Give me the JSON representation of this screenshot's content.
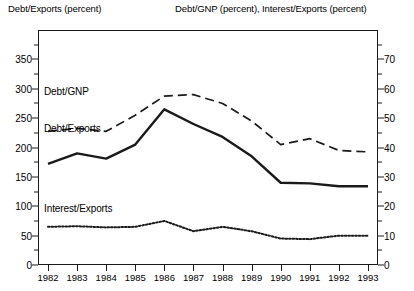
{
  "titles": {
    "left_axis": "Debt/Exports (percent)",
    "right_axis": "Debt/GNP (percent), Interest/Exports (percent)"
  },
  "series_labels": {
    "debt_gnp": "Debt/GNP",
    "debt_exports": "Debt/Exports",
    "interest_exports": "Interest/Exports"
  },
  "axes": {
    "left_ticks": [
      "0",
      "50",
      "100",
      "150",
      "200",
      "250",
      "300",
      "350"
    ],
    "right_ticks": [
      "0",
      "10",
      "20",
      "30",
      "40",
      "50",
      "60",
      "70"
    ],
    "x_ticks": [
      "1982",
      "1983",
      "1984",
      "1985",
      "1986",
      "1987",
      "1988",
      "1989",
      "1990",
      "1991",
      "1992",
      "1993"
    ]
  },
  "chart_data": {
    "type": "line",
    "title": "",
    "xlabel": "",
    "ylabel": "Debt/Exports (percent)",
    "y2label": "Debt/GNP (percent), Interest/Exports (percent)",
    "x": [
      1982,
      1983,
      1984,
      1985,
      1986,
      1987,
      1988,
      1989,
      1990,
      1991,
      1992,
      1993
    ],
    "categories": [
      "1982",
      "1983",
      "1984",
      "1985",
      "1986",
      "1987",
      "1988",
      "1989",
      "1990",
      "1991",
      "1992",
      "1993"
    ],
    "ylim": [
      0,
      400
    ],
    "y2lim": [
      0,
      80
    ],
    "left_ticks": [
      0,
      50,
      100,
      150,
      200,
      250,
      300,
      350
    ],
    "right_ticks": [
      0,
      10,
      20,
      30,
      40,
      50,
      60,
      70
    ],
    "grid": false,
    "legend": "inline-annotations",
    "series": [
      {
        "name": "Debt/Exports",
        "axis": "left",
        "style": "solid",
        "color": "#1a1a1a",
        "values": [
          172,
          190,
          181,
          205,
          265,
          240,
          218,
          185,
          140,
          139,
          134,
          134
        ]
      },
      {
        "name": "Debt/GNP",
        "axis": "right",
        "style": "dashed",
        "color": "#1a1a1a",
        "values": [
          45.5,
          46.5,
          45.5,
          51.0,
          57.5,
          58.0,
          55.0,
          49.0,
          41.0,
          43.0,
          39.0,
          38.5
        ]
      },
      {
        "name": "Interest/Exports",
        "axis": "right",
        "style": "dotted",
        "color": "#1a1a1a",
        "values": [
          13.0,
          13.2,
          12.8,
          13.0,
          15.0,
          11.5,
          13.0,
          11.5,
          9.0,
          8.8,
          10.0,
          10.0
        ]
      }
    ]
  }
}
